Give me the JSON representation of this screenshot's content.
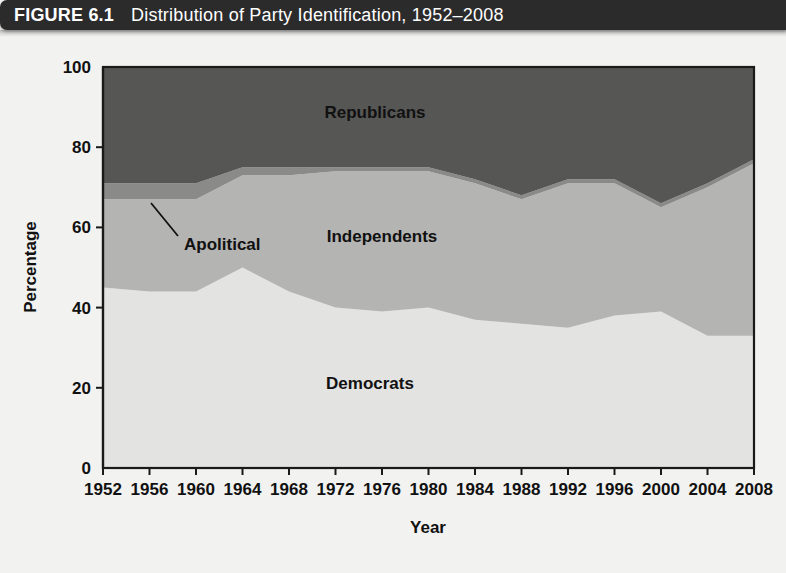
{
  "figure": {
    "number_label": "FIGURE 6.1",
    "title": "Distribution of Party Identification, 1952–2008"
  },
  "colors": {
    "democrats": "#e3e3e1",
    "independents": "#b4b4b2",
    "apolitical": "#8a8a88",
    "republicans": "#565654",
    "axis": "#1a1a1a",
    "banner_bg": "#2b2b2b",
    "banner_text": "#ffffff",
    "page_bg": "#f2f2f0"
  },
  "annotations": {
    "apolitical_callout": "Apolitical"
  },
  "chart_data": {
    "type": "area",
    "stacked": true,
    "title": "Distribution of Party Identification, 1952–2008",
    "xlabel": "Year",
    "ylabel": "Percentage",
    "xlim": [
      1952,
      2008
    ],
    "ylim": [
      0,
      100
    ],
    "grid": false,
    "legend_position": "inline-labels",
    "x": [
      1952,
      1956,
      1960,
      1964,
      1968,
      1972,
      1976,
      1980,
      1984,
      1988,
      1992,
      1996,
      2000,
      2004,
      2008
    ],
    "xticks": [
      "1952",
      "1956",
      "1960",
      "1964",
      "1968",
      "1972",
      "1976",
      "1980",
      "1984",
      "1988",
      "1992",
      "1996",
      "2000",
      "2004",
      "2008"
    ],
    "yticks": [
      "0",
      "20",
      "40",
      "60",
      "80",
      "100"
    ],
    "series": [
      {
        "name": "Democrats",
        "color": "#e3e3e1",
        "values": [
          45,
          44,
          44,
          50,
          44,
          40,
          39,
          40,
          37,
          36,
          35,
          38,
          39,
          33,
          33
        ]
      },
      {
        "name": "Independents",
        "color": "#b4b4b2",
        "values": [
          22,
          23,
          23,
          23,
          29,
          34,
          35,
          34,
          34,
          31,
          36,
          33,
          26,
          37,
          43
        ]
      },
      {
        "name": "Apolitical",
        "color": "#8a8a88",
        "values": [
          4,
          4,
          4,
          2,
          2,
          1,
          1,
          1,
          1,
          1,
          1,
          1,
          1,
          1,
          1
        ]
      },
      {
        "name": "Republicans",
        "color": "#565654",
        "values": [
          29,
          29,
          29,
          25,
          25,
          25,
          25,
          25,
          28,
          32,
          28,
          28,
          34,
          29,
          23
        ]
      }
    ],
    "cumulative_tops": {
      "democrats": [
        45,
        44,
        44,
        50,
        44,
        40,
        39,
        40,
        37,
        36,
        35,
        38,
        39,
        33,
        33
      ],
      "independents": [
        67,
        67,
        67,
        73,
        73,
        74,
        74,
        74,
        71,
        67,
        71,
        71,
        65,
        70,
        76
      ],
      "apolitical": [
        71,
        71,
        71,
        75,
        75,
        75,
        75,
        75,
        72,
        68,
        72,
        72,
        66,
        71,
        77
      ],
      "republicans": [
        100,
        100,
        100,
        100,
        100,
        100,
        100,
        100,
        100,
        100,
        100,
        100,
        100,
        100,
        100
      ]
    }
  }
}
